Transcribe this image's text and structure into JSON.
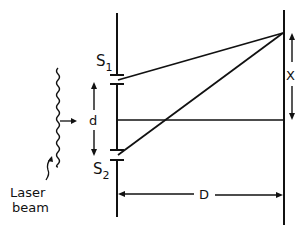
{
  "diagram": {
    "labels": {
      "slit1": "S",
      "slit1_sub": "1",
      "slit2": "S",
      "slit2_sub": "2",
      "separation": "d",
      "screen_distance": "D",
      "fringe_distance": "X",
      "source_line1": "Laser",
      "source_line2": "beam"
    },
    "colors": {
      "ink": "#111111",
      "background": "#ffffff"
    }
  }
}
